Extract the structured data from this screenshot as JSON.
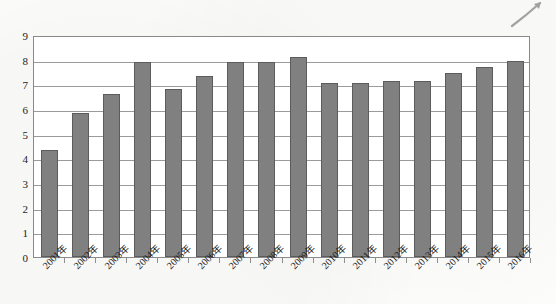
{
  "chart_data": {
    "type": "bar",
    "title": "",
    "subtitle": "",
    "xlabel": "",
    "ylabel": "",
    "categories": [
      "2001年",
      "2002年",
      "2003年",
      "2004年",
      "2005年",
      "2006年",
      "2007年",
      "2008年",
      "2009年",
      "2010年",
      "2011年",
      "2012年",
      "2013年",
      "2014年",
      "2015年",
      "2016年"
    ],
    "values": [
      4.35,
      5.85,
      6.6,
      7.9,
      6.8,
      7.35,
      7.9,
      7.9,
      8.1,
      7.05,
      7.05,
      7.15,
      7.15,
      7.45,
      7.7,
      7.95
    ],
    "ylim": [
      0,
      9
    ],
    "ytick_labels": [
      "9",
      "8",
      "7",
      "6",
      "5",
      "4",
      "3",
      "2",
      "1",
      "0"
    ],
    "ytick_values": [
      9,
      8,
      7,
      6,
      5,
      4,
      3,
      2,
      1,
      0
    ],
    "grid": true,
    "grid_axis": "y",
    "legend": false,
    "legend_position": "none",
    "bar_color": "#808080",
    "bar_border_color": "#5c5c5c",
    "gridline_color": "#9b9b9b",
    "axis_color": "#8a8a8a",
    "background_color": "#ffffff",
    "xlabel_rotation": -45
  },
  "artifacts": {
    "scan_mark": "pen-stroke-artifact"
  }
}
